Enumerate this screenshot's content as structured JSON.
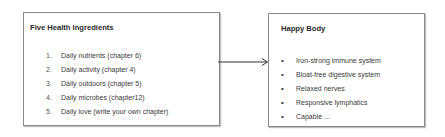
{
  "left_box": {
    "title": "Five Health Ingredients",
    "items": [
      {
        "num": "1.",
        "text": "Daily nutrients (chapter 6)"
      },
      {
        "num": "2.",
        "text": "Daily activity (chapter 4)"
      },
      {
        "num": "3.",
        "text": "Daily outdoors (chapter 5)"
      },
      {
        "num": "4.",
        "text": "Daily microbes (chapter12)"
      },
      {
        "num": "5.",
        "text": "Daily love (write your own chapter)"
      }
    ]
  },
  "right_box": {
    "title": "Happy Body",
    "bullet": "•",
    "items": [
      {
        "text": "Iron-strong immune system"
      },
      {
        "text": "Bloat-free digestive system"
      },
      {
        "text": "Relaxed nerves"
      },
      {
        "text": "Responsive lymphatics"
      },
      {
        "text": "Capable ..."
      }
    ]
  },
  "arrow": {
    "color": "#333333"
  }
}
